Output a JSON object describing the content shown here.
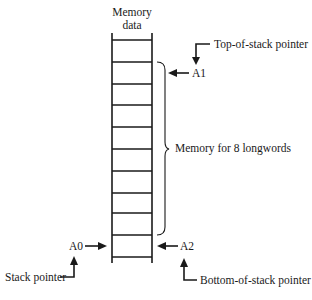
{
  "diagram": {
    "column_header": {
      "line1": "Memory",
      "line2": "data"
    },
    "cells": {
      "count": 10,
      "brace_cell_count": 8
    },
    "labels": {
      "top_of_stack": "Top-of-stack pointer",
      "a1": "A1",
      "brace": "Memory for 8 longwords",
      "a0": "A0",
      "a2": "A2",
      "stack_pointer": "Stack pointer",
      "bottom_of_stack": "Bottom-of-stack pointer"
    }
  }
}
